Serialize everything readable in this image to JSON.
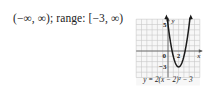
{
  "answer_text": "(−∞, ∞); range: [−3, ∞)",
  "chart_data": {
    "type": "line",
    "title": "",
    "equation_label": "y = 2(x − 2)² − 3",
    "function": {
      "a": 2,
      "h": 2,
      "k": -3
    },
    "vertex": [
      2,
      -3
    ],
    "xlabel": "x",
    "ylabel": "y",
    "xlim": [
      -6,
      6
    ],
    "ylim": [
      -5,
      6
    ],
    "grid": true,
    "tick_labels": [
      {
        "text": "5",
        "axis": "y",
        "value": 5
      },
      {
        "text": "0",
        "axis": "origin",
        "value": 0
      },
      {
        "text": "2",
        "axis": "x",
        "value": 2
      },
      {
        "text": "−3",
        "axis": "y",
        "value": -3
      }
    ],
    "colors": {
      "curve": "#1a1a1a",
      "grid": "#c8c8c8",
      "axis": "#555555"
    }
  }
}
